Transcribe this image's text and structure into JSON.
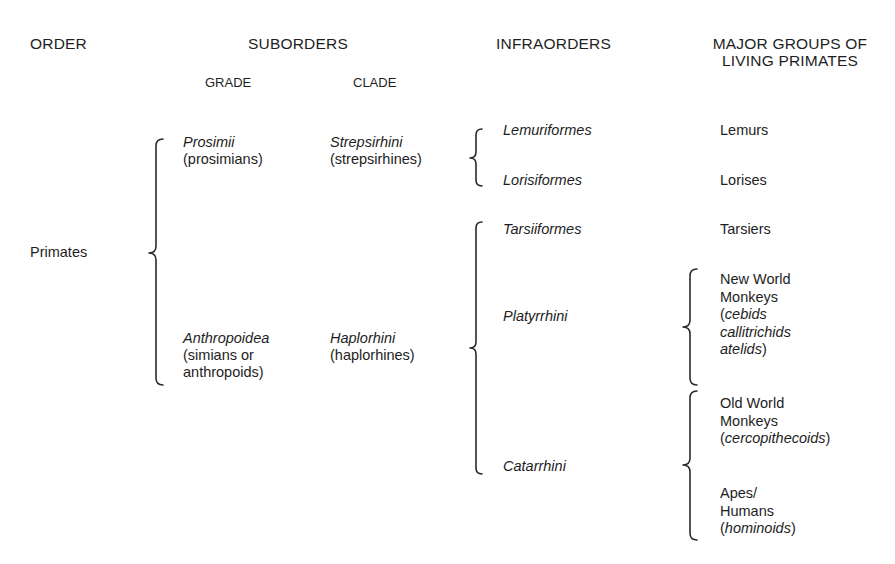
{
  "headers": {
    "order": "ORDER",
    "suborders": "SUBORDERS",
    "grade": "GRADE",
    "clade": "CLADE",
    "infraorders": "INFRAORDERS",
    "major_groups_line1": "MAJOR GROUPS OF",
    "major_groups_line2": "LIVING PRIMATES"
  },
  "order": {
    "name": "Primates"
  },
  "suborders": [
    {
      "grade": {
        "name": "Prosimii",
        "common": "(prosimians)"
      },
      "clade": {
        "name": "Strepsirhini",
        "common": "(strepsirhines)"
      },
      "infraorders": [
        {
          "name": "Lemuriformes",
          "group": "Lemurs"
        },
        {
          "name": "Lorisiformes",
          "group": "Lorises"
        }
      ]
    },
    {
      "grade": {
        "name": "Anthropoidea",
        "common_line1": "(simians or",
        "common_line2": "anthropoids)"
      },
      "clade": {
        "name": "Haplorhini",
        "common": "(haplorhines)"
      },
      "infraorders": [
        {
          "name": "Tarsiiformes",
          "group": "Tarsiers"
        },
        {
          "name": "Platyrrhini",
          "groups": [
            {
              "line1": "New World",
              "line2": "Monkeys",
              "families": [
                "cebids",
                "callitrichids",
                "atelids"
              ]
            }
          ]
        },
        {
          "name": "Catarrhini",
          "groups": [
            {
              "line1": "Old World",
              "line2": "Monkeys",
              "families": [
                "cercopithecoids"
              ]
            },
            {
              "line1": "Apes/",
              "line2": "Humans",
              "families": [
                "hominoids"
              ]
            }
          ]
        }
      ]
    }
  ],
  "punct": {
    "open": "(",
    "close": ")"
  },
  "colors": {
    "text": "#1e1e1e",
    "bracket": "#2a2a2a",
    "background": "#ffffff"
  }
}
